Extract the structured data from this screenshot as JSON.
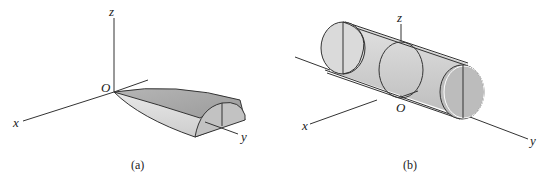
{
  "figures": [
    {
      "id": "a",
      "caption": "(a)",
      "description": "Tapered half-body (paraboloid half-shell) lying along the y-axis, vertex at the origin O",
      "axes": {
        "x": "x",
        "y": "y",
        "z": "z",
        "origin": "O"
      },
      "colors": {
        "top_surface": "#a9a9a9",
        "side_surface": "#d9d9d9",
        "end_face": "#bdbdbd"
      }
    },
    {
      "id": "b",
      "caption": "(b)",
      "description": "Circular cylinder with its axis parallel to the y-axis, showing cross-section circles",
      "axes": {
        "x": "x",
        "y": "y",
        "z": "z",
        "origin": "O"
      },
      "colors": {
        "body": "#d4d4d4",
        "end_face": "#bfbfbf"
      }
    }
  ]
}
